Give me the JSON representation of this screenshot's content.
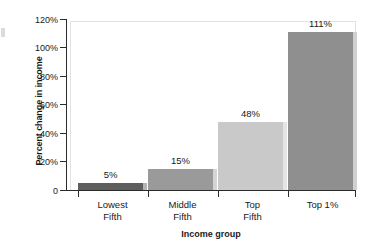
{
  "chart_data": {
    "type": "bar",
    "title": "",
    "xlabel": "Income group",
    "ylabel": "Percent change in income",
    "categories": [
      "Lowest Fifth",
      "Middle Fifth",
      "Top Fifth",
      "Top 1%"
    ],
    "category_lines": [
      [
        "Lowest",
        "Fifth"
      ],
      [
        "Middle",
        "Fifth"
      ],
      [
        "Top",
        "Fifth"
      ],
      [
        "Top 1%",
        ""
      ]
    ],
    "values": [
      5,
      15,
      48,
      111
    ],
    "value_labels": [
      "5%",
      "15%",
      "48%",
      "111%"
    ],
    "ylim": [
      0,
      120
    ],
    "yticks": [
      0,
      20,
      40,
      60,
      80,
      100,
      120
    ],
    "ytick_labels": [
      "0",
      "20%",
      "40%",
      "60%",
      "80%",
      "100%",
      "120%"
    ],
    "grid": false,
    "legend": false,
    "bar_colors": [
      "#5e5e5e",
      "#9a9a9a",
      "#c9c9c9",
      "#8f8f8f"
    ],
    "bar_edge_colors": [
      "#b4b4b4",
      "#d4d4d4",
      "#e4e4e4",
      "#d0d0d0"
    ],
    "axis_color": "#2b2b2b",
    "frame_color": "#e2e2e2",
    "background": "#ffffff"
  }
}
